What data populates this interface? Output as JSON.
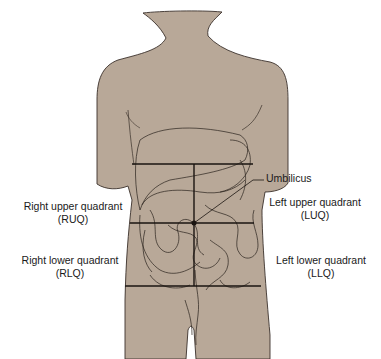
{
  "diagram": {
    "colors": {
      "skin": "#b8a898",
      "outline": "#3a302a",
      "line": "#1a1410"
    },
    "labels": {
      "umbilicus": "Umbilicus",
      "ruq": {
        "name": "Right upper quadrant",
        "abbr": "(RUQ)"
      },
      "luq": {
        "name": "Left upper quadrant",
        "abbr": "(LUQ)"
      },
      "rlq": {
        "name": "Right lower quadrant",
        "abbr": "(RLQ)"
      },
      "llq": {
        "name": "Left lower quadrant",
        "abbr": "(LLQ)"
      }
    }
  }
}
